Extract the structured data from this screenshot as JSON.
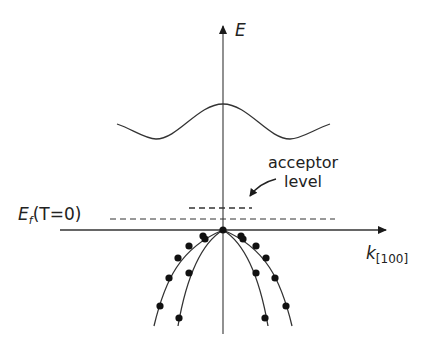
{
  "diagram": {
    "y_axis_label": "E",
    "x_axis_label": "k",
    "x_axis_subscript": "[100]",
    "fermi_label_main": "E",
    "fermi_label_sub": "f",
    "fermi_label_rest": "(T=0)",
    "acceptor_label_line1": "acceptor",
    "acceptor_label_line2": "level",
    "colors": {
      "line": "#2a2a2a",
      "axis": "#555555",
      "background": "#ffffff"
    }
  }
}
